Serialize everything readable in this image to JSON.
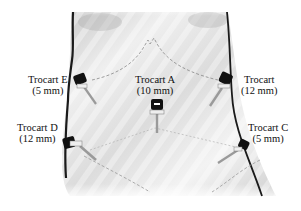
{
  "figure": {
    "colors": {
      "background": "#ffffff",
      "skin_light": "#f2f2f2",
      "skin_shade": "#bdbdbd",
      "outline": "#1a1a1a",
      "dashed_line": "#888888",
      "trocart_cap": "#111111",
      "trocart_shaft": "#9a9a9a"
    }
  },
  "trocarts": [
    {
      "id": "A",
      "name": "Trocart A",
      "size": "(10 mm)"
    },
    {
      "id": "B",
      "name": "Trocart",
      "size": "(12 mm)"
    },
    {
      "id": "C",
      "name": "Trocart C",
      "size": "(5 mm)"
    },
    {
      "id": "D",
      "name": "Trocart D",
      "size": "(12 mm)"
    },
    {
      "id": "E",
      "name": "Trocart E",
      "size": "(5 mm)"
    }
  ]
}
